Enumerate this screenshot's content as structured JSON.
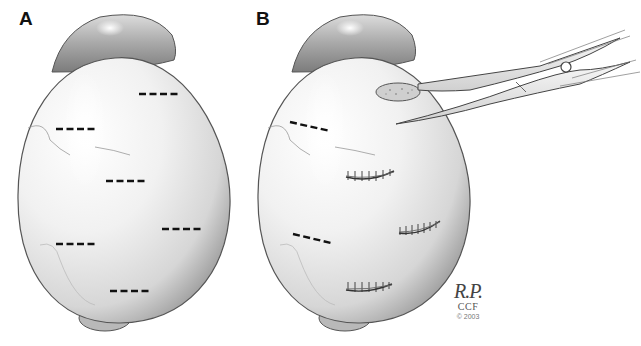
{
  "figure": {
    "panels": [
      {
        "label": "A",
        "description": "Globe viewed from above with marked incision sites (dashed lines)",
        "incision_marks": [
          {
            "x1": 139,
            "y1": 94,
            "x2": 179,
            "y2": 94
          },
          {
            "x1": 56,
            "y1": 129,
            "x2": 96,
            "y2": 129
          },
          {
            "x1": 106,
            "y1": 181,
            "x2": 146,
            "y2": 181
          },
          {
            "x1": 162,
            "y1": 229,
            "x2": 202,
            "y2": 229
          },
          {
            "x1": 56,
            "y1": 244,
            "x2": 96,
            "y2": 244
          },
          {
            "x1": 110,
            "y1": 291,
            "x2": 150,
            "y2": 291
          }
        ]
      },
      {
        "label": "B",
        "description": "Incisions with tissue excision by scissors and sutured closures",
        "incision_marks": [
          {
            "x1": 290,
            "y1": 122,
            "x2": 330,
            "y2": 131
          },
          {
            "x1": 293,
            "y1": 234,
            "x2": 331,
            "y2": 243
          }
        ],
        "sutures": [
          {
            "cx": 370,
            "cy": 175,
            "w": 48
          },
          {
            "cx": 420,
            "cy": 230,
            "w": 40
          },
          {
            "cx": 368,
            "cy": 286,
            "w": 46
          }
        ],
        "instrument": "curved scissors",
        "excised_tissue": "oval tissue fragment"
      }
    ],
    "signature": {
      "initials": "R.P.",
      "organization": "CCF",
      "copyright": "© 2003"
    },
    "colors": {
      "outline": "#444444",
      "shading": "#bbbbbb",
      "highlight": "#fafafa",
      "marks": "#111111"
    }
  }
}
